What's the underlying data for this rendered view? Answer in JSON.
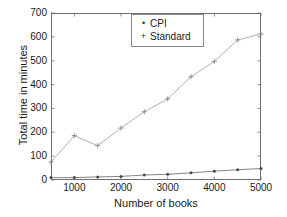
{
  "chart_data": {
    "type": "line",
    "title": "",
    "xlabel": "Number of books",
    "ylabel": "Total time in minutes",
    "xlim": [
      500,
      5000
    ],
    "ylim": [
      0,
      700
    ],
    "xticks": [
      1000,
      2000,
      3000,
      4000,
      5000
    ],
    "xtick_labels": [
      "1000",
      "2000",
      "3000",
      "4000",
      "5000"
    ],
    "yticks": [
      0,
      100,
      200,
      300,
      400,
      500,
      600,
      700
    ],
    "ytick_labels": [
      "0",
      "100",
      "200",
      "300",
      "400",
      "500",
      "600",
      "700"
    ],
    "grid": false,
    "legend_position": "top-center",
    "x": [
      500,
      1000,
      1500,
      2000,
      2500,
      3000,
      3500,
      4000,
      4500,
      5000
    ],
    "series": [
      {
        "name": "CPI",
        "marker": "dot",
        "color": "#4a4a4a",
        "values": [
          10,
          10,
          13,
          15,
          21,
          24,
          30,
          37,
          43,
          48
        ]
      },
      {
        "name": "Standard",
        "marker": "plus",
        "color": "#8a8a8a",
        "values": [
          75,
          186,
          144,
          218,
          286,
          340,
          433,
          497,
          587,
          612
        ]
      }
    ]
  },
  "legend": {
    "items": [
      {
        "label": "CPI",
        "marker": "•"
      },
      {
        "label": "Standard",
        "marker": "+"
      }
    ]
  },
  "colors": {
    "axis": "#6f6f6f",
    "text": "#1a1a1a",
    "cpi": "#4a4a4a",
    "standard": "#8a8a8a",
    "background": "#ffffff"
  }
}
